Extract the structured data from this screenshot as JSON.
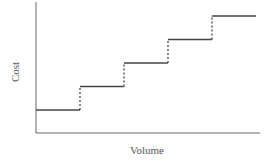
{
  "chart_data": {
    "type": "line",
    "subtype": "step",
    "title": "",
    "xlabel": "Volume",
    "ylabel": "Cost",
    "grid": false,
    "legend": null,
    "x": [
      0,
      1,
      1,
      2,
      2,
      3,
      3,
      4,
      4,
      5
    ],
    "series": [
      {
        "name": "Step fixed cost",
        "values": [
          1,
          1,
          2,
          2,
          3,
          3,
          4,
          4,
          5,
          5
        ]
      }
    ],
    "steps": [
      {
        "from": 0,
        "to": 1,
        "level": 1
      },
      {
        "from": 1,
        "to": 2,
        "level": 2
      },
      {
        "from": 2,
        "to": 3,
        "level": 3
      },
      {
        "from": 3,
        "to": 4,
        "level": 4
      },
      {
        "from": 4,
        "to": 5,
        "level": 5
      }
    ],
    "jumps_style": "dashed",
    "xticks": [],
    "yticks": []
  },
  "axes": {
    "xlabel": "Volume",
    "ylabel": "Cost"
  }
}
